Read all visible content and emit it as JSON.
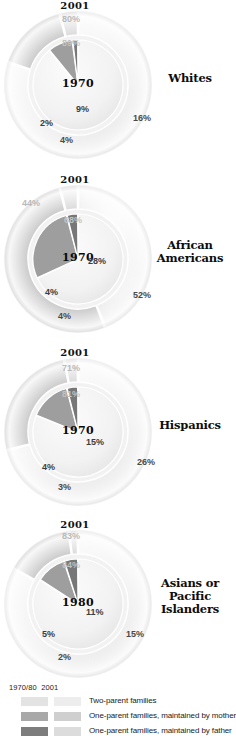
{
  "figure": {
    "outer_ring_year_label": "2001",
    "legend_header_left": "1970/80",
    "legend_header_right": "2001"
  },
  "legend": {
    "items": [
      {
        "key": "two-parent",
        "label": "Two-parent families",
        "color_old": "#e3e3e3",
        "color_new": "#ededed"
      },
      {
        "key": "one-parent-mother",
        "label": "One-parent families, maintained by mother",
        "color_old": "#a8a8a8",
        "color_new": "#cfcfcf"
      },
      {
        "key": "one-parent-father",
        "label": "One-parent families, maintained by father",
        "color_old": "#7d7d7d",
        "color_new": "#dcdcdc"
      }
    ]
  },
  "chart_data": [
    {
      "type": "pie",
      "title": "Whites",
      "inner_year": "1970",
      "outer_year": "2001",
      "categories": [
        "Two-parent families",
        "One-parent families, maintained by mother",
        "One-parent families, maintained by father"
      ],
      "series": [
        {
          "name": "1970",
          "values": [
            89,
            9,
            2
          ],
          "labels": [
            "89%",
            "9%",
            "2%"
          ]
        },
        {
          "name": "2001",
          "values": [
            80,
            16,
            4
          ],
          "labels": [
            "80%",
            "16%",
            "4%"
          ]
        }
      ]
    },
    {
      "type": "pie",
      "title": "African Americans",
      "inner_year": "1970",
      "outer_year": "2001",
      "categories": [
        "Two-parent families",
        "One-parent families, maintained by mother",
        "One-parent families, maintained by father"
      ],
      "series": [
        {
          "name": "1970",
          "values": [
            68,
            28,
            4
          ],
          "labels": [
            "68%",
            "28%",
            "4%"
          ]
        },
        {
          "name": "2001",
          "values": [
            44,
            52,
            4
          ],
          "labels": [
            "44%",
            "52%",
            "4%"
          ]
        }
      ]
    },
    {
      "type": "pie",
      "title": "Hispanics",
      "inner_year": "1970",
      "outer_year": "2001",
      "categories": [
        "Two-parent families",
        "One-parent families, maintained by mother",
        "One-parent families, maintained by father"
      ],
      "series": [
        {
          "name": "1970",
          "values": [
            81,
            15,
            4
          ],
          "labels": [
            "81%",
            "15%",
            "4%"
          ]
        },
        {
          "name": "2001",
          "values": [
            71,
            26,
            3
          ],
          "labels": [
            "71%",
            "26%",
            "3%"
          ]
        }
      ]
    },
    {
      "type": "pie",
      "title": "Asians or Pacific Islanders",
      "inner_year": "1980",
      "outer_year": "2001",
      "categories": [
        "Two-parent families",
        "One-parent families, maintained by mother",
        "One-parent families, maintained by father"
      ],
      "series": [
        {
          "name": "1980",
          "values": [
            84,
            11,
            5
          ],
          "labels": [
            "84%",
            "11%",
            "5%"
          ]
        },
        {
          "name": "2001",
          "values": [
            83,
            15,
            2
          ],
          "labels": [
            "83%",
            "15%",
            "2%"
          ]
        }
      ]
    }
  ]
}
